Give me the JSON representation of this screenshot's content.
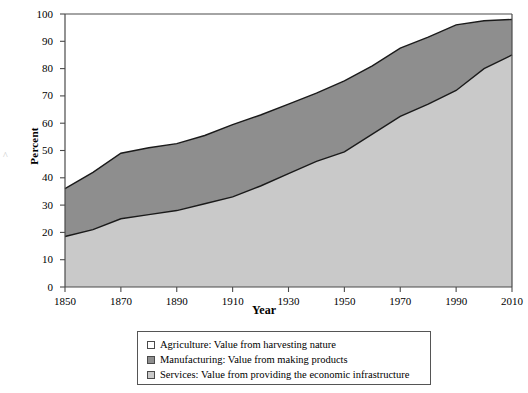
{
  "chart_data": {
    "type": "area",
    "title": "",
    "xlabel": "Year",
    "ylabel": "Percent",
    "xlim": [
      1850,
      2010
    ],
    "ylim": [
      0,
      100
    ],
    "grid": false,
    "stacked": true,
    "legend_position": "bottom",
    "x": [
      1850,
      1860,
      1870,
      1880,
      1890,
      1900,
      1910,
      1920,
      1930,
      1940,
      1950,
      1960,
      1970,
      1980,
      1990,
      2000,
      2010
    ],
    "xticks": [
      "1850",
      "1870",
      "1890",
      "1910",
      "1930",
      "1950",
      "1970",
      "1990",
      "2010"
    ],
    "yticks": [
      "0",
      "10",
      "20",
      "30",
      "40",
      "50",
      "60",
      "70",
      "80",
      "90",
      "100"
    ],
    "series": [
      {
        "name": "Services: Value from providing the economic infrastructure",
        "short_name": "Services",
        "description": "Value from providing the economic infrastructure",
        "color": "#c9c9c9",
        "values": [
          18.5,
          21,
          25,
          26.5,
          28,
          30.5,
          33,
          37,
          41.5,
          46,
          49.5,
          56,
          62.5,
          67,
          72,
          80,
          85
        ]
      },
      {
        "name": "Manufacturing: Value from making products",
        "short_name": "Manufacturing",
        "description": "Value from making products",
        "color": "#8e8e8e",
        "values": [
          17.5,
          21,
          24,
          24.5,
          24.5,
          25,
          26.5,
          26,
          25.5,
          25,
          26,
          25,
          24.5,
          24.5,
          24,
          17.5,
          13
        ]
      },
      {
        "name": "Agriculture: Value from harvesting nature",
        "short_name": "Agriculture",
        "description": "Value from harvesting nature",
        "color": "#ffffff",
        "values": [
          64,
          58,
          51,
          49,
          47.5,
          44.5,
          40.5,
          37,
          33,
          29,
          24.5,
          19,
          13,
          8.5,
          4,
          2.5,
          2
        ]
      }
    ],
    "cumulative_upper_band": [
      36,
      42,
      49,
      51,
      52.5,
      55.5,
      59.5,
      63,
      67,
      71,
      75.5,
      81,
      87.5,
      91.5,
      96,
      97.5,
      98
    ]
  },
  "axis": {
    "ylabel": "Percent",
    "xlabel": "Year"
  },
  "legend": {
    "rows": [
      {
        "swatch": "#ffffff",
        "label": "Agriculture: Value from harvesting nature"
      },
      {
        "swatch": "#8e8e8e",
        "label": "Manufacturing: Value from making products"
      },
      {
        "swatch": "#c9c9c9",
        "label": "Services: Value from providing the economic infrastructure"
      }
    ]
  },
  "colors": {
    "agriculture": "#ffffff",
    "manufacturing": "#8e8e8e",
    "services": "#c9c9c9",
    "axis": "#4a4a4a",
    "curve": "#1a1a1a"
  }
}
